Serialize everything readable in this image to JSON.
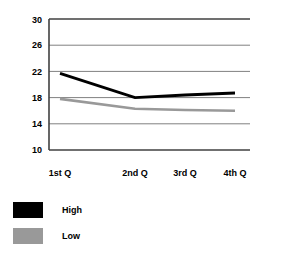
{
  "chart_data": {
    "type": "line",
    "title": "",
    "xlabel": "",
    "ylabel": "",
    "categories": [
      "1st Q",
      "2nd Q",
      "3rd Q",
      "4th Q"
    ],
    "series": [
      {
        "name": "High",
        "color": "#000000",
        "values": [
          21.7,
          18.0,
          18.4,
          18.7
        ]
      },
      {
        "name": "Low",
        "color": "#999999",
        "values": [
          17.8,
          16.3,
          16.1,
          16.0
        ]
      }
    ],
    "ylim": [
      10,
      30
    ],
    "yticks": [
      10,
      14,
      18,
      22,
      26,
      30
    ],
    "ytick_labels": [
      "10",
      "14",
      "18",
      "22",
      "26",
      "30"
    ],
    "grid": true,
    "grid_axis": "y",
    "grid_color": "#808080",
    "axis_color": "#000000",
    "legend_position": "below-left",
    "legend": [
      {
        "label": "High",
        "color": "#000000"
      },
      {
        "label": "Low",
        "color": "#999999"
      }
    ]
  },
  "axis": {
    "ytick_0": "10",
    "ytick_1": "14",
    "ytick_2": "18",
    "ytick_3": "22",
    "ytick_4": "26",
    "ytick_5": "30",
    "xtick_0": "1st Q",
    "xtick_1": "2nd Q",
    "xtick_2": "3rd Q",
    "xtick_3": "4th Q"
  },
  "legend": {
    "high_label": "High",
    "low_label": "Low"
  }
}
